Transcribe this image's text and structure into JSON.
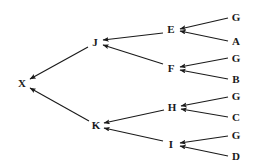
{
  "diagram": {
    "type": "tree",
    "orientation": "right-to-left",
    "edge_style": "straight-arrow",
    "background_color": "#ffffff",
    "line_color": "#1a1a1a",
    "label_color": "#1a1a1a",
    "root": "X",
    "depth": 4,
    "node_count": 15,
    "leaf_count": 8,
    "nodes": [
      {
        "id": "X",
        "label": "X",
        "x": 22,
        "y": 83,
        "level": 0,
        "role": "root"
      },
      {
        "id": "J",
        "label": "J",
        "x": 95,
        "y": 42,
        "level": 1,
        "role": "internal"
      },
      {
        "id": "K",
        "label": "K",
        "x": 96,
        "y": 125,
        "level": 1,
        "role": "internal"
      },
      {
        "id": "E",
        "label": "E",
        "x": 171,
        "y": 29,
        "level": 2,
        "role": "internal"
      },
      {
        "id": "F",
        "label": "F",
        "x": 171,
        "y": 68,
        "level": 2,
        "role": "internal"
      },
      {
        "id": "H",
        "label": "H",
        "x": 172,
        "y": 107,
        "level": 2,
        "role": "internal"
      },
      {
        "id": "I",
        "label": "I",
        "x": 171,
        "y": 144,
        "level": 2,
        "role": "internal"
      },
      {
        "id": "L1",
        "label": "G",
        "x": 236,
        "y": 17,
        "level": 3,
        "role": "leaf"
      },
      {
        "id": "L2",
        "label": "A",
        "x": 236,
        "y": 41,
        "level": 3,
        "role": "leaf"
      },
      {
        "id": "L3",
        "label": "G",
        "x": 236,
        "y": 58,
        "level": 3,
        "role": "leaf"
      },
      {
        "id": "L4",
        "label": "B",
        "x": 236,
        "y": 79,
        "level": 3,
        "role": "leaf"
      },
      {
        "id": "L5",
        "label": "G",
        "x": 236,
        "y": 96,
        "level": 3,
        "role": "leaf"
      },
      {
        "id": "L6",
        "label": "C",
        "x": 236,
        "y": 117,
        "level": 3,
        "role": "leaf"
      },
      {
        "id": "L7",
        "label": "G",
        "x": 236,
        "y": 135,
        "level": 3,
        "role": "leaf"
      },
      {
        "id": "L8",
        "label": "D",
        "x": 236,
        "y": 156,
        "level": 3,
        "role": "leaf"
      }
    ],
    "edges": [
      {
        "from": "J",
        "to": "X",
        "x1": 88,
        "y1": 47,
        "x2": 30,
        "y2": 79
      },
      {
        "from": "K",
        "to": "X",
        "x1": 89,
        "y1": 121,
        "x2": 30,
        "y2": 88
      },
      {
        "from": "E",
        "to": "J",
        "x1": 163,
        "y1": 33,
        "x2": 103,
        "y2": 40
      },
      {
        "from": "F",
        "to": "J",
        "x1": 163,
        "y1": 64,
        "x2": 103,
        "y2": 45
      },
      {
        "from": "H",
        "to": "K",
        "x1": 164,
        "y1": 110,
        "x2": 104,
        "y2": 123
      },
      {
        "from": "I",
        "to": "K",
        "x1": 163,
        "y1": 141,
        "x2": 104,
        "y2": 128
      },
      {
        "from": "L1",
        "to": "E",
        "x1": 228,
        "y1": 18,
        "x2": 180,
        "y2": 29
      },
      {
        "from": "L2",
        "to": "E",
        "x1": 228,
        "y1": 41,
        "x2": 180,
        "y2": 31
      },
      {
        "from": "L3",
        "to": "F",
        "x1": 228,
        "y1": 58,
        "x2": 180,
        "y2": 67
      },
      {
        "from": "L4",
        "to": "F",
        "x1": 228,
        "y1": 79,
        "x2": 180,
        "y2": 70
      },
      {
        "from": "L5",
        "to": "H",
        "x1": 228,
        "y1": 97,
        "x2": 181,
        "y2": 106
      },
      {
        "from": "L6",
        "to": "H",
        "x1": 228,
        "y1": 117,
        "x2": 181,
        "y2": 109
      },
      {
        "from": "L7",
        "to": "I",
        "x1": 228,
        "y1": 136,
        "x2": 180,
        "y2": 143
      },
      {
        "from": "L8",
        "to": "I",
        "x1": 228,
        "y1": 156,
        "x2": 180,
        "y2": 146
      }
    ]
  }
}
